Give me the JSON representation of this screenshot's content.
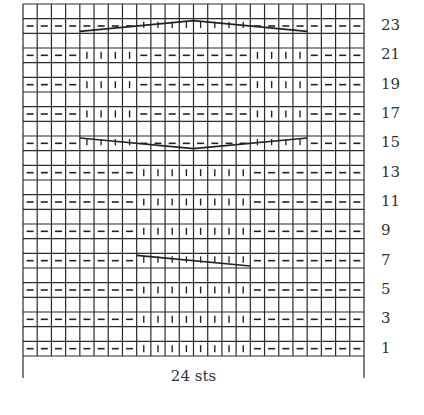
{
  "chart": {
    "columns": 24,
    "rows": 24,
    "width_label": "24 sts",
    "row_labels": [
      "1",
      "3",
      "5",
      "7",
      "9",
      "11",
      "13",
      "15",
      "17",
      "19",
      "21",
      "23"
    ],
    "legend_symbols": {
      "-": "purl",
      "|": "knit"
    },
    "pattern_rows": [
      {
        "row": 1,
        "stitches": "--------||||||||--------"
      },
      {
        "row": 3,
        "stitches": "--------||||||||--------"
      },
      {
        "row": 5,
        "stitches": "--------||||||||--------"
      },
      {
        "row": 7,
        "stitches": "--------TTTTTTTT--------",
        "cable": {
          "start_col": 9,
          "end_col": 16,
          "shape": "diagonal-down-right"
        }
      },
      {
        "row": 9,
        "stitches": "--------||||||||--------"
      },
      {
        "row": 11,
        "stitches": "--------||||||||--------"
      },
      {
        "row": 13,
        "stitches": "--------||||||||--------"
      },
      {
        "row": 15,
        "stitches": "----TTTT--------TTTT----",
        "cable": {
          "start_col": 5,
          "end_col": 20,
          "shape": "v"
        }
      },
      {
        "row": 17,
        "stitches": "----||||--------||||----"
      },
      {
        "row": 19,
        "stitches": "----||||--------||||----"
      },
      {
        "row": 21,
        "stitches": "----||||--------||||----"
      },
      {
        "row": 23,
        "stitches": "--------TTTTTTTT--------",
        "cable": {
          "start_col": 5,
          "end_col": 20,
          "shape": "inverted-v"
        }
      }
    ]
  },
  "colors": {
    "grid": "#2a2a2a",
    "symbol": "#222222",
    "background": "#ffffff"
  }
}
